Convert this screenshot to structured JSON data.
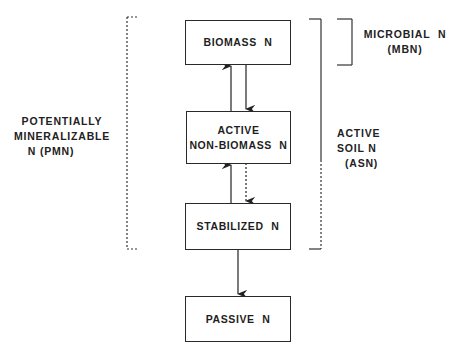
{
  "diagram": {
    "boxes": [
      {
        "id": "biomass",
        "lines": [
          "BIOMASS  N"
        ]
      },
      {
        "id": "active-non-biomass",
        "lines": [
          "ACTIVE",
          "NON-BIOMASS  N"
        ]
      },
      {
        "id": "stabilized",
        "lines": [
          "STABILIZED  N"
        ]
      },
      {
        "id": "passive",
        "lines": [
          "PASSIVE  N"
        ]
      }
    ],
    "brackets": [
      {
        "id": "pmn",
        "lines": [
          "POTENTIALLY",
          "MINERALIZABLE",
          "N (PMN)"
        ],
        "style": "dotted"
      },
      {
        "id": "asn",
        "lines": [
          "ACTIVE",
          "SOIL N",
          "(ASN)"
        ],
        "style": "solid-upper, dotted-lower"
      },
      {
        "id": "mbn",
        "lines": [
          "MICROBIAL  N",
          "(MBN)"
        ],
        "style": "solid"
      }
    ],
    "arrows": [
      {
        "from": "active-non-biomass",
        "to": "biomass",
        "style": "solid"
      },
      {
        "from": "biomass",
        "to": "active-non-biomass",
        "style": "solid"
      },
      {
        "from": "stabilized",
        "to": "active-non-biomass",
        "style": "solid"
      },
      {
        "from": "active-non-biomass",
        "to": "stabilized",
        "style": "dotted"
      },
      {
        "from": "stabilized",
        "to": "passive",
        "style": "solid"
      }
    ]
  }
}
